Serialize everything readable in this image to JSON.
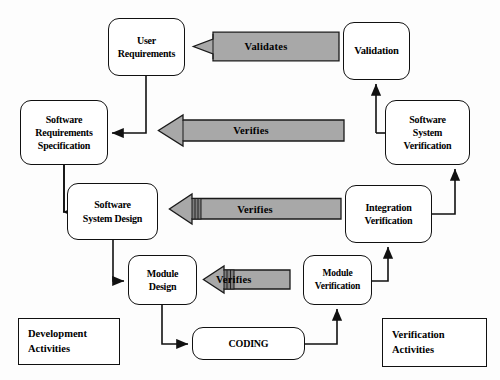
{
  "diagram": {
    "colors": {
      "arrow_fill": "#a8a8a8",
      "arrow_stroke": "#1a1a1a",
      "box_fill": "#ffffff",
      "box_stroke": "#111111",
      "text": "#000000",
      "background": "#fdfdfd"
    },
    "nodes": [
      {
        "id": "user-requirements",
        "lines": [
          "User",
          "Requirements"
        ],
        "x": 108,
        "y": 18,
        "w": 77,
        "h": 58,
        "font": 10
      },
      {
        "id": "software-requirements-specification",
        "lines": [
          "Software",
          "Requirements",
          "Specification"
        ],
        "x": 20,
        "y": 100,
        "w": 88,
        "h": 65,
        "font": 10
      },
      {
        "id": "software-system-design",
        "lines": [
          "Software",
          "System Design"
        ],
        "x": 67,
        "y": 183,
        "w": 91,
        "h": 57,
        "font": 10
      },
      {
        "id": "module-design",
        "lines": [
          "Module",
          "Design"
        ],
        "x": 128,
        "y": 255,
        "w": 69,
        "h": 50,
        "font": 10
      },
      {
        "id": "coding",
        "lines": [
          "CODING"
        ],
        "x": 192,
        "y": 327,
        "w": 113,
        "h": 33,
        "font": 10
      },
      {
        "id": "module-verification",
        "lines": [
          "Module",
          "Verification"
        ],
        "x": 303,
        "y": 255,
        "w": 69,
        "h": 50,
        "font": 9.5
      },
      {
        "id": "integration-verification",
        "lines": [
          "Integration",
          "Verification"
        ],
        "x": 345,
        "y": 185,
        "w": 87,
        "h": 58,
        "font": 10
      },
      {
        "id": "software-system-verification",
        "lines": [
          "Software",
          "System",
          "Verification"
        ],
        "x": 385,
        "y": 100,
        "w": 85,
        "h": 65,
        "font": 10
      },
      {
        "id": "validation",
        "lines": [
          "Validation"
        ],
        "x": 343,
        "y": 22,
        "w": 67,
        "h": 58,
        "font": 10.5
      }
    ],
    "arrows": [
      {
        "id": "validates-arrow",
        "label": "Validates",
        "x": 192,
        "y": 31,
        "w": 148,
        "h": 31,
        "font": 10.5,
        "short": false
      },
      {
        "id": "verifies-arrow-requirements",
        "label": "Verifies",
        "x": 157,
        "y": 114,
        "w": 188,
        "h": 33,
        "font": 10.5,
        "short": false
      },
      {
        "id": "verifies-arrow-design",
        "label": "Verifies",
        "x": 168,
        "y": 193,
        "w": 174,
        "h": 32,
        "font": 10.5,
        "short": false
      },
      {
        "id": "verifies-arrow-module",
        "label": "Verifies",
        "x": 202,
        "y": 265,
        "w": 89,
        "h": 29,
        "font": 10.5,
        "short": true
      }
    ],
    "legend": [
      {
        "id": "development-activities",
        "lines": [
          "Development",
          "Activities"
        ],
        "x": 18,
        "y": 318,
        "w": 102,
        "h": 47,
        "font": 10.5
      },
      {
        "id": "verification-activities",
        "lines": [
          "Verification",
          "Activities"
        ],
        "x": 382,
        "y": 318,
        "w": 105,
        "h": 49,
        "font": 10.5
      }
    ]
  }
}
